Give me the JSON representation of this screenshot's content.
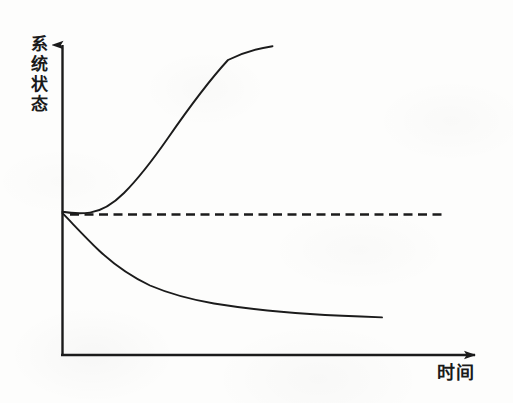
{
  "figure": {
    "axes": {
      "y_axis_label": "系统状态",
      "y_axis_label_chars": [
        "系",
        "统",
        "状",
        "态"
      ],
      "x_axis_label": "时间"
    },
    "ink_color": "#1b1b1b",
    "paper_color": "#fdfdfc"
  },
  "chart_data": {
    "type": "line",
    "title": "",
    "subtitle": "",
    "xlabel": "时间",
    "ylabel": "系统状态",
    "grid": false,
    "legend": false,
    "legend_position": "none",
    "axis_style": "arrow-headed schematic axes, no tick marks, no numeric scale",
    "xlim": [
      0,
      1
    ],
    "ylim": [
      0,
      1
    ],
    "annotations": [],
    "series": [
      {
        "name": "发散 (divergent / unstable growth)",
        "style": "solid",
        "description": "Starts at the equilibrium value, dips marginally below it, then grows exponentially away upward.",
        "x": [
          0.0,
          0.04,
          0.07,
          0.1,
          0.14,
          0.19,
          0.24,
          0.29,
          0.34,
          0.39,
          0.44,
          0.49
        ],
        "y": [
          0.445,
          0.44,
          0.438,
          0.443,
          0.463,
          0.505,
          0.56,
          0.63,
          0.71,
          0.8,
          0.89,
          0.975
        ]
      },
      {
        "name": "收敛衰减 (decaying / damped decline)",
        "style": "solid",
        "description": "Starts at the equilibrium value and decays monotonically, flattening into a slow near-linear drift.",
        "x": [
          0.0,
          0.05,
          0.1,
          0.16,
          0.22,
          0.29,
          0.37,
          0.45,
          0.54,
          0.63,
          0.72,
          0.8
        ],
        "y": [
          0.44,
          0.39,
          0.34,
          0.288,
          0.248,
          0.214,
          0.19,
          0.173,
          0.159,
          0.147,
          0.136,
          0.126
        ]
      },
      {
        "name": "平衡基准 (equilibrium reference)",
        "style": "dashed",
        "description": "Horizontal dashed reference line held at the initial equilibrium state value.",
        "x": [
          0.02,
          0.9
        ],
        "y": [
          0.437,
          0.437
        ]
      }
    ]
  }
}
